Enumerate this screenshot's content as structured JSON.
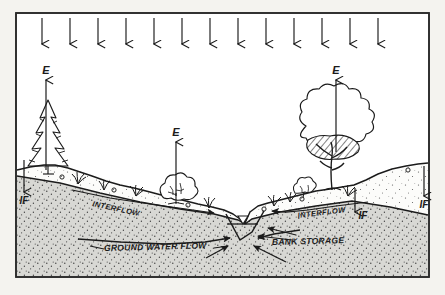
{
  "figure": {
    "name": "hydrologic-cycle-cross-section",
    "page_background": "#f4f3ef",
    "ink_color": "#1b1b1b",
    "border_color": "#2a2a2a",
    "unsaturated_zone_fill": "#fcfcfa",
    "saturated_zone_fill": "#d6d6d2",
    "stipple_color": "#4a4a4a"
  },
  "labels": {
    "evaporation_left": "E",
    "evaporation_middle": "E",
    "evaporation_right": "E",
    "infiltration_left": "IF",
    "infiltration_center_right": "IF",
    "infiltration_right": "IF",
    "interflow_left": "INTERFLOW",
    "interflow_right": "INTERFLOW",
    "ground_water_flow": "GROUND WATER FLOW",
    "bank_storage": "BANK STORAGE"
  },
  "precipitation": {
    "name": "precipitation-arrows",
    "count": 13,
    "direction": "down",
    "x_positions": [
      42,
      70,
      98,
      126,
      154,
      182,
      210,
      238,
      266,
      294,
      322,
      350,
      378
    ],
    "y_top": 18,
    "y_bottom": 46
  },
  "evaporation_arrows": [
    {
      "name": "evaporation-arrow-left",
      "x": 46,
      "y_top": 78,
      "y_bottom": 170,
      "label": "E",
      "label_x": 46,
      "label_y": 73
    },
    {
      "name": "evaporation-arrow-middle",
      "x": 176,
      "y_top": 140,
      "y_bottom": 196,
      "label": "E",
      "label_x": 176,
      "label_y": 135
    },
    {
      "name": "evaporation-arrow-right",
      "x": 336,
      "y_top": 78,
      "y_bottom": 152,
      "label": "E",
      "label_x": 336,
      "label_y": 73
    }
  ],
  "infiltration_arrows": [
    {
      "name": "infiltration-arrow-left",
      "x": 24,
      "y_top": 160,
      "y_bottom": 192,
      "label": "IF",
      "label_x": 24,
      "label_y": 203
    },
    {
      "name": "infiltration-arrow-center-right",
      "x": 355,
      "y_top": 190,
      "y_bottom": 212,
      "label": "IF",
      "label_x": 362,
      "label_y": 219
    },
    {
      "name": "infiltration-arrow-right",
      "x": 424,
      "y_top": 168,
      "y_bottom": 196,
      "label": "IF",
      "label_x": 424,
      "label_y": 207
    }
  ],
  "vegetation": [
    {
      "name": "conifer-tree-left",
      "type": "conifer",
      "x": 48,
      "base_y": 172,
      "height": 72
    },
    {
      "name": "shrub-middle",
      "type": "shrub",
      "x": 176,
      "base_y": 204,
      "width": 34
    },
    {
      "name": "deciduous-tree-right",
      "type": "deciduous",
      "x": 330,
      "base_y": 190,
      "height": 92
    },
    {
      "name": "shrub-right-small",
      "type": "shrub",
      "x": 303,
      "base_y": 196,
      "width": 22
    }
  ],
  "grass_tufts": [
    {
      "name": "grass-tuft",
      "x": 78,
      "base_y": 184
    },
    {
      "name": "grass-tuft",
      "x": 104,
      "base_y": 190
    },
    {
      "name": "grass-tuft",
      "x": 136,
      "base_y": 196
    },
    {
      "name": "grass-tuft",
      "x": 209,
      "base_y": 208
    },
    {
      "name": "grass-tuft",
      "x": 274,
      "base_y": 206
    },
    {
      "name": "grass-tuft",
      "x": 290,
      "base_y": 202
    },
    {
      "name": "grass-tuft",
      "x": 348,
      "base_y": 196
    }
  ],
  "stream": {
    "name": "stream-channel",
    "water_surface_y": 224,
    "channel_bottom_y": 240,
    "left_bank_x": 226,
    "right_bank_x": 264,
    "water_symbol": "▽"
  },
  "interflow_paths": [
    {
      "name": "interflow-path-left",
      "label": "INTERFLOW",
      "label_x": 108,
      "label_y": 202,
      "rotation": -14
    },
    {
      "name": "interflow-path-right",
      "label": "INTERFLOW",
      "label_x": 318,
      "label_y": 215,
      "rotation": 9
    }
  ],
  "subsurface_labels": {
    "ground_water_flow": {
      "name": "ground-water-flow-label",
      "text": "GROUND WATER FLOW",
      "x": 155,
      "y": 248,
      "rotation": -2
    },
    "bank_storage": {
      "name": "bank-storage-label",
      "text": "BANK STORAGE",
      "x": 305,
      "y": 243,
      "rotation": -2
    }
  },
  "zones": {
    "unsaturated": {
      "name": "unsaturated-zone",
      "description": "light stippled soil above water table"
    },
    "saturated": {
      "name": "saturated-zone",
      "description": "dark stippled soil below water table"
    }
  }
}
